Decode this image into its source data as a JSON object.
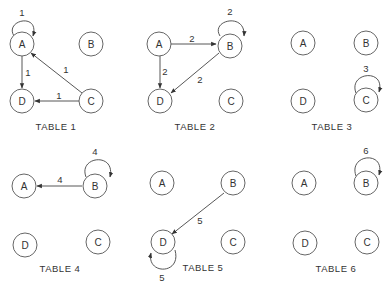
{
  "panels": [
    {
      "title": "TABLE 1",
      "nodes": [
        {
          "id": "A",
          "label": "A"
        },
        {
          "id": "B",
          "label": "B"
        },
        {
          "id": "C",
          "label": "C"
        },
        {
          "id": "D",
          "label": "D"
        }
      ],
      "edges": [
        {
          "from": "A",
          "to": "A",
          "weight": "1"
        },
        {
          "from": "A",
          "to": "D",
          "weight": "1"
        },
        {
          "from": "C",
          "to": "A",
          "weight": "1"
        },
        {
          "from": "C",
          "to": "D",
          "weight": "1"
        }
      ]
    },
    {
      "title": "TABLE 2",
      "nodes": [
        {
          "id": "A",
          "label": "A"
        },
        {
          "id": "B",
          "label": "B"
        },
        {
          "id": "C",
          "label": "C"
        },
        {
          "id": "D",
          "label": "D"
        }
      ],
      "edges": [
        {
          "from": "B",
          "to": "B",
          "weight": "2"
        },
        {
          "from": "A",
          "to": "B",
          "weight": "2"
        },
        {
          "from": "A",
          "to": "D",
          "weight": "2"
        },
        {
          "from": "B",
          "to": "D",
          "weight": "2"
        }
      ]
    },
    {
      "title": "TABLE 3",
      "nodes": [
        {
          "id": "A",
          "label": "A"
        },
        {
          "id": "B",
          "label": "B"
        },
        {
          "id": "C",
          "label": "C"
        },
        {
          "id": "D",
          "label": "D"
        }
      ],
      "edges": [
        {
          "from": "C",
          "to": "C",
          "weight": "3"
        }
      ]
    },
    {
      "title": "TABLE 4",
      "nodes": [
        {
          "id": "A",
          "label": "A"
        },
        {
          "id": "B",
          "label": "B"
        },
        {
          "id": "C",
          "label": "C"
        },
        {
          "id": "D",
          "label": "D"
        }
      ],
      "edges": [
        {
          "from": "B",
          "to": "B",
          "weight": "4"
        },
        {
          "from": "B",
          "to": "A",
          "weight": "4"
        }
      ]
    },
    {
      "title": "TABLE 5",
      "nodes": [
        {
          "id": "A",
          "label": "A"
        },
        {
          "id": "B",
          "label": "B"
        },
        {
          "id": "C",
          "label": "C"
        },
        {
          "id": "D",
          "label": "D"
        }
      ],
      "edges": [
        {
          "from": "B",
          "to": "D",
          "weight": "5"
        },
        {
          "from": "D",
          "to": "D",
          "weight": "5"
        }
      ]
    },
    {
      "title": "TABLE 6",
      "nodes": [
        {
          "id": "A",
          "label": "A"
        },
        {
          "id": "B",
          "label": "B"
        },
        {
          "id": "C",
          "label": "C"
        },
        {
          "id": "D",
          "label": "D"
        }
      ],
      "edges": [
        {
          "from": "B",
          "to": "B",
          "weight": "6"
        }
      ]
    }
  ]
}
